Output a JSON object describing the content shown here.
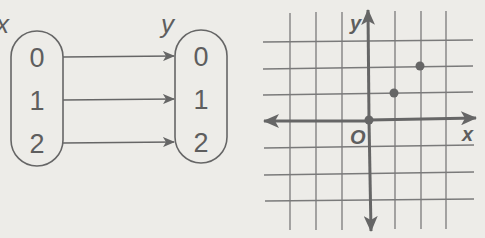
{
  "colors": {
    "background": "#edece8",
    "stroke": "#666666",
    "grid": "#7a7a7a",
    "axis": "#666666",
    "point": "#666666"
  },
  "mapping": {
    "domain_label": "x",
    "range_label": "y",
    "domain_values": [
      "0",
      "1",
      "2"
    ],
    "range_values": [
      "0",
      "1",
      "2"
    ],
    "arrows": [
      {
        "from": "0",
        "to": "0"
      },
      {
        "from": "1",
        "to": "1"
      },
      {
        "from": "2",
        "to": "2"
      }
    ]
  },
  "graph": {
    "x_axis_label": "x",
    "y_axis_label": "y",
    "origin_label": "O",
    "points": [
      {
        "x": 0,
        "y": 0
      },
      {
        "x": 1,
        "y": 1
      },
      {
        "x": 2,
        "y": 2
      }
    ]
  }
}
